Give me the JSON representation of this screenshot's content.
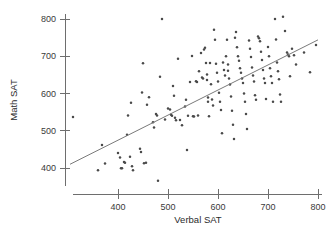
{
  "chart_data": {
    "type": "scatter",
    "title": "",
    "xlabel": "Verbal SAT",
    "ylabel": "Math SAT",
    "xlim": [
      300,
      810
    ],
    "ylim": [
      355,
      815
    ],
    "xticks": [
      400,
      500,
      600,
      700,
      800
    ],
    "yticks": [
      400,
      500,
      600,
      700,
      800
    ],
    "xticklabels": [
      "400",
      "500",
      "600",
      "700",
      "800"
    ],
    "yticklabels": [
      "400",
      "500",
      "600",
      "700",
      "800"
    ],
    "grid": false,
    "legend": null,
    "marker_color": "#4a4a4a",
    "line_color": "#7a7a7a",
    "axis_color": "#6e6e6e",
    "background_color": "#ffffff",
    "trendline": {
      "name": "least-squares fit",
      "x_start": 304,
      "y_start": 410,
      "x_end": 800,
      "y_end": 744
    },
    "points": [
      [
        310,
        537
      ],
      [
        360,
        394
      ],
      [
        368,
        462
      ],
      [
        374,
        412
      ],
      [
        400,
        440
      ],
      [
        404,
        428
      ],
      [
        406,
        399
      ],
      [
        408,
        399
      ],
      [
        412,
        416
      ],
      [
        414,
        414
      ],
      [
        418,
        489
      ],
      [
        420,
        541
      ],
      [
        424,
        430
      ],
      [
        426,
        575
      ],
      [
        428,
        405
      ],
      [
        430,
        394
      ],
      [
        444,
        452
      ],
      [
        446,
        443
      ],
      [
        448,
        603
      ],
      [
        450,
        681
      ],
      [
        452,
        413
      ],
      [
        456,
        414
      ],
      [
        458,
        570
      ],
      [
        462,
        590
      ],
      [
        470,
        523
      ],
      [
        472,
        509
      ],
      [
        476,
        545
      ],
      [
        478,
        541
      ],
      [
        480,
        366
      ],
      [
        484,
        645
      ],
      [
        488,
        800
      ],
      [
        494,
        530
      ],
      [
        500,
        560
      ],
      [
        504,
        557
      ],
      [
        506,
        543
      ],
      [
        508,
        540
      ],
      [
        510,
        620
      ],
      [
        512,
        594
      ],
      [
        514,
        535
      ],
      [
        516,
        528
      ],
      [
        520,
        693
      ],
      [
        524,
        529
      ],
      [
        528,
        515
      ],
      [
        534,
        565
      ],
      [
        536,
        583
      ],
      [
        538,
        448
      ],
      [
        540,
        540
      ],
      [
        544,
        631
      ],
      [
        548,
        701
      ],
      [
        550,
        539
      ],
      [
        552,
        538
      ],
      [
        556,
        633
      ],
      [
        558,
        631
      ],
      [
        560,
        541
      ],
      [
        562,
        660
      ],
      [
        566,
        709
      ],
      [
        568,
        643
      ],
      [
        570,
        640
      ],
      [
        572,
        718
      ],
      [
        574,
        723
      ],
      [
        576,
        682
      ],
      [
        578,
        651
      ],
      [
        578,
        636
      ],
      [
        580,
        589
      ],
      [
        580,
        578
      ],
      [
        582,
        539
      ],
      [
        584,
        682
      ],
      [
        586,
        625
      ],
      [
        588,
        584
      ],
      [
        590,
        568
      ],
      [
        592,
        771
      ],
      [
        594,
        744
      ],
      [
        596,
        680
      ],
      [
        598,
        656
      ],
      [
        600,
        632
      ],
      [
        602,
        602
      ],
      [
        604,
        578
      ],
      [
        606,
        556
      ],
      [
        608,
        493
      ],
      [
        610,
        683
      ],
      [
        612,
        663
      ],
      [
        614,
        648
      ],
      [
        616,
        700
      ],
      [
        618,
        744
      ],
      [
        620,
        678
      ],
      [
        620,
        661
      ],
      [
        622,
        640
      ],
      [
        624,
        624
      ],
      [
        626,
        592
      ],
      [
        628,
        554
      ],
      [
        630,
        516
      ],
      [
        632,
        478
      ],
      [
        634,
        750
      ],
      [
        636,
        765
      ],
      [
        638,
        724
      ],
      [
        640,
        700
      ],
      [
        642,
        688
      ],
      [
        644,
        668
      ],
      [
        646,
        656
      ],
      [
        648,
        640
      ],
      [
        650,
        628
      ],
      [
        652,
        600
      ],
      [
        654,
        578
      ],
      [
        656,
        545
      ],
      [
        658,
        505
      ],
      [
        662,
        742
      ],
      [
        664,
        720
      ],
      [
        666,
        698
      ],
      [
        668,
        670
      ],
      [
        670,
        648
      ],
      [
        672,
        632
      ],
      [
        674,
        595
      ],
      [
        676,
        583
      ],
      [
        680,
        753
      ],
      [
        682,
        748
      ],
      [
        684,
        740
      ],
      [
        686,
        712
      ],
      [
        688,
        690
      ],
      [
        690,
        663
      ],
      [
        692,
        640
      ],
      [
        694,
        628
      ],
      [
        696,
        585
      ],
      [
        700,
        725
      ],
      [
        702,
        700
      ],
      [
        704,
        668
      ],
      [
        706,
        646
      ],
      [
        708,
        628
      ],
      [
        710,
        578
      ],
      [
        714,
        800
      ],
      [
        716,
        745
      ],
      [
        718,
        683
      ],
      [
        720,
        660
      ],
      [
        722,
        638
      ],
      [
        724,
        597
      ],
      [
        726,
        578
      ],
      [
        730,
        806
      ],
      [
        734,
        768
      ],
      [
        738,
        710
      ],
      [
        740,
        705
      ],
      [
        742,
        700
      ],
      [
        744,
        646
      ],
      [
        748,
        720
      ],
      [
        752,
        703
      ],
      [
        756,
        678
      ],
      [
        772,
        710
      ],
      [
        784,
        657
      ],
      [
        796,
        730
      ]
    ]
  }
}
